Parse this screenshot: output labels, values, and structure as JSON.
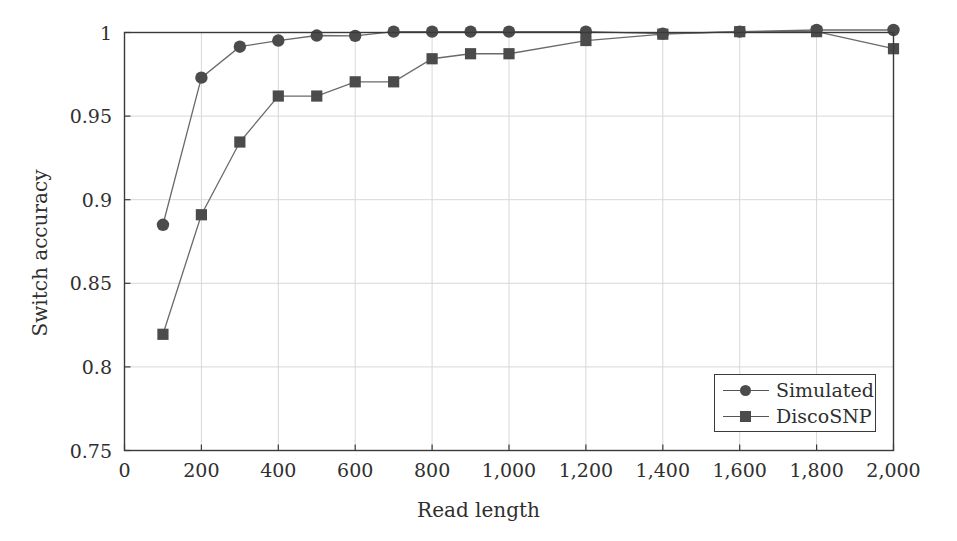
{
  "chart_data": {
    "type": "line",
    "title": "",
    "xlabel": "Read length",
    "ylabel": "Switch accuracy",
    "xlim": [
      0,
      2000
    ],
    "ylim": [
      0.75,
      1.0
    ],
    "grid": true,
    "legend_position": "bottom-right",
    "xticks": [
      0,
      200,
      400,
      600,
      800,
      1000,
      1200,
      1400,
      1600,
      1800,
      2000
    ],
    "xtick_labels": [
      "0",
      "200",
      "400",
      "600",
      "800",
      "1,000",
      "1,200",
      "1,400",
      "1,600",
      "1,800",
      "2,000"
    ],
    "yticks": [
      0.75,
      0.8,
      0.85,
      0.9,
      0.95,
      1.0
    ],
    "ytick_labels": [
      "0.75",
      "0.8",
      "0.85",
      "0.9",
      "0.95",
      "1"
    ],
    "x": [
      100,
      200,
      300,
      400,
      500,
      600,
      700,
      800,
      900,
      1000,
      1200,
      1400,
      1600,
      1800,
      2000
    ],
    "series": [
      {
        "name": "Simulated",
        "marker": "circle",
        "color": "#4b4b4b",
        "values": [
          0.885,
          0.973,
          0.9915,
          0.9952,
          0.9982,
          0.998,
          1.0005,
          1.0005,
          1.0005,
          1.0005,
          1.0005,
          0.9993,
          1.0005,
          1.0015,
          1.0015
        ]
      },
      {
        "name": "DiscoSNP",
        "marker": "square",
        "color": "#4b4b4b",
        "values": [
          0.8195,
          0.891,
          0.9345,
          0.962,
          0.962,
          0.9705,
          0.9705,
          0.9843,
          0.9873,
          0.9873,
          0.9952,
          0.999,
          1.0005,
          1.0005,
          0.9903
        ]
      }
    ]
  },
  "legend": {
    "entries": [
      {
        "label": "Simulated"
      },
      {
        "label": "DiscoSNP"
      }
    ]
  }
}
